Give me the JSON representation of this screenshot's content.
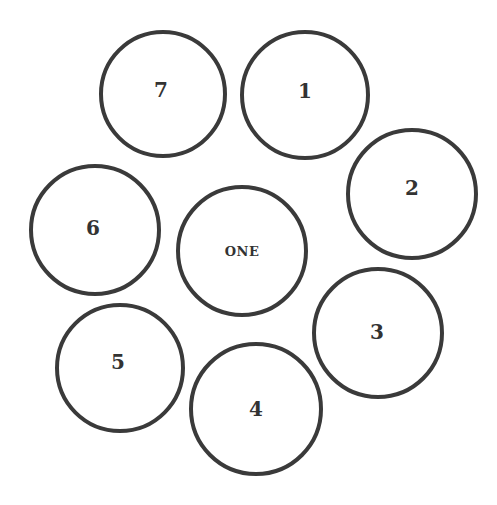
{
  "diagram": {
    "stroke_color": "#3a3a3a",
    "label_color": "#333333",
    "center": {
      "label": "ONE",
      "cx": 242,
      "cy": 251,
      "r": 66,
      "label_dx": 0,
      "label_dy": 0
    },
    "nodes": [
      {
        "label": "1",
        "cx": 305,
        "cy": 95,
        "r": 65,
        "label_dx": 0,
        "label_dy": -4
      },
      {
        "label": "2",
        "cx": 412,
        "cy": 194,
        "r": 66,
        "label_dx": 0,
        "label_dy": -6
      },
      {
        "label": "3",
        "cx": 378,
        "cy": 333,
        "r": 66,
        "label_dx": -1,
        "label_dy": -1
      },
      {
        "label": "4",
        "cx": 256,
        "cy": 409,
        "r": 67,
        "label_dx": 0,
        "label_dy": 0
      },
      {
        "label": "5",
        "cx": 120,
        "cy": 368,
        "r": 65,
        "label_dx": -2,
        "label_dy": -6
      },
      {
        "label": "6",
        "cx": 95,
        "cy": 230,
        "r": 66,
        "label_dx": -2,
        "label_dy": -2
      },
      {
        "label": "7",
        "cx": 163,
        "cy": 94,
        "r": 64,
        "label_dx": -2,
        "label_dy": -4
      }
    ]
  }
}
